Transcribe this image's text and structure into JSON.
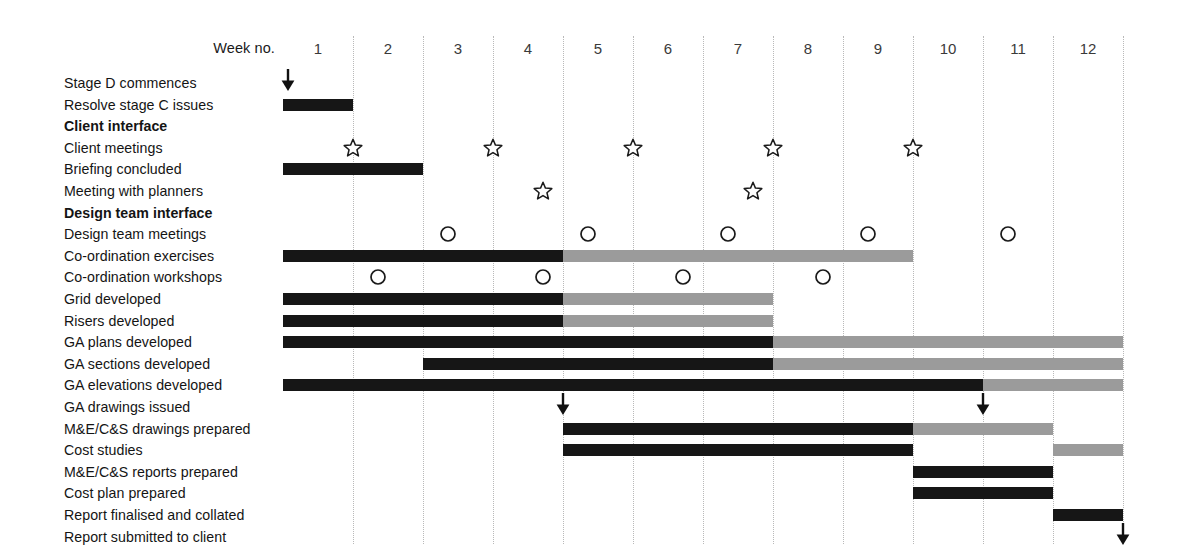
{
  "chart_data": {
    "type": "gantt",
    "title": "",
    "xlabel": "Week no.",
    "week_header_label": "Week no.",
    "weeks": [
      "1",
      "2",
      "3",
      "4",
      "5",
      "6",
      "7",
      "8",
      "9",
      "10",
      "11",
      "12"
    ],
    "week_count": 12,
    "colors": {
      "bar_primary": "#161616",
      "bar_secondary": "#9b9b9b",
      "gridline": "#b9b9b9",
      "text": "#141414",
      "background": "#ffffff"
    },
    "legend": [],
    "rows": [
      {
        "label": "Stage D commences",
        "bold": false,
        "bars": [],
        "markers": [],
        "arrows": [
          {
            "week": 1.07
          }
        ]
      },
      {
        "label": "Resolve stage C issues",
        "bold": false,
        "bars": [
          {
            "start": 1.0,
            "end": 2.0,
            "color": "black"
          }
        ],
        "markers": [],
        "arrows": []
      },
      {
        "label": "Client interface",
        "bold": true,
        "bars": [],
        "markers": [],
        "arrows": []
      },
      {
        "label": "Client meetings",
        "bold": false,
        "bars": [],
        "markers": [
          {
            "shape": "star",
            "week": 2.0
          },
          {
            "shape": "star",
            "week": 4.0
          },
          {
            "shape": "star",
            "week": 6.0
          },
          {
            "shape": "star",
            "week": 8.0
          },
          {
            "shape": "star",
            "week": 10.0
          }
        ],
        "arrows": []
      },
      {
        "label": "Briefing concluded",
        "bold": false,
        "bars": [
          {
            "start": 1.0,
            "end": 3.0,
            "color": "black"
          }
        ],
        "markers": [],
        "arrows": []
      },
      {
        "label": "Meeting with planners",
        "bold": false,
        "bars": [],
        "markers": [
          {
            "shape": "star",
            "week": 4.72
          },
          {
            "shape": "star",
            "week": 7.72
          }
        ],
        "arrows": []
      },
      {
        "label": "Design team interface",
        "bold": true,
        "bars": [],
        "markers": [],
        "arrows": []
      },
      {
        "label": "Design team meetings",
        "bold": false,
        "bars": [],
        "markers": [
          {
            "shape": "circle",
            "week": 3.36
          },
          {
            "shape": "circle",
            "week": 5.36
          },
          {
            "shape": "circle",
            "week": 7.36
          },
          {
            "shape": "circle",
            "week": 9.36
          },
          {
            "shape": "circle",
            "week": 11.36
          }
        ],
        "arrows": []
      },
      {
        "label": "Co-ordination exercises",
        "bold": false,
        "bars": [
          {
            "start": 1.0,
            "end": 5.0,
            "color": "black"
          },
          {
            "start": 5.0,
            "end": 10.0,
            "color": "grey"
          }
        ],
        "markers": [],
        "arrows": []
      },
      {
        "label": "Co-ordination workshops",
        "bold": false,
        "bars": [],
        "markers": [
          {
            "shape": "circle",
            "week": 2.36
          },
          {
            "shape": "circle",
            "week": 4.72
          },
          {
            "shape": "circle",
            "week": 6.72
          },
          {
            "shape": "circle",
            "week": 8.72
          }
        ],
        "arrows": []
      },
      {
        "label": "Grid developed",
        "bold": false,
        "bars": [
          {
            "start": 1.0,
            "end": 5.0,
            "color": "black"
          },
          {
            "start": 5.0,
            "end": 8.0,
            "color": "grey"
          }
        ],
        "markers": [],
        "arrows": []
      },
      {
        "label": "Risers developed",
        "bold": false,
        "bars": [
          {
            "start": 1.0,
            "end": 5.0,
            "color": "black"
          },
          {
            "start": 5.0,
            "end": 8.0,
            "color": "grey"
          }
        ],
        "markers": [],
        "arrows": []
      },
      {
        "label": "GA plans developed",
        "bold": false,
        "bars": [
          {
            "start": 1.0,
            "end": 8.0,
            "color": "black"
          },
          {
            "start": 8.0,
            "end": 13.0,
            "color": "grey"
          }
        ],
        "markers": [],
        "arrows": []
      },
      {
        "label": "GA sections developed",
        "bold": false,
        "bars": [
          {
            "start": 3.0,
            "end": 8.0,
            "color": "black"
          },
          {
            "start": 8.0,
            "end": 13.0,
            "color": "grey"
          }
        ],
        "markers": [],
        "arrows": []
      },
      {
        "label": "GA elevations developed",
        "bold": false,
        "bars": [
          {
            "start": 1.0,
            "end": 11.0,
            "color": "black"
          },
          {
            "start": 11.0,
            "end": 13.0,
            "color": "grey"
          }
        ],
        "markers": [],
        "arrows": []
      },
      {
        "label": "GA drawings issued",
        "bold": false,
        "bars": [],
        "markers": [],
        "arrows": [
          {
            "week": 5.0
          },
          {
            "week": 11.0
          }
        ]
      },
      {
        "label": "M&E/C&S drawings prepared",
        "bold": false,
        "bars": [
          {
            "start": 5.0,
            "end": 10.0,
            "color": "black"
          },
          {
            "start": 10.0,
            "end": 12.0,
            "color": "grey"
          }
        ],
        "markers": [],
        "arrows": []
      },
      {
        "label": "Cost studies",
        "bold": false,
        "bars": [
          {
            "start": 5.0,
            "end": 10.0,
            "color": "black"
          },
          {
            "start": 12.0,
            "end": 13.0,
            "color": "grey"
          }
        ],
        "markers": [],
        "arrows": []
      },
      {
        "label": "M&E/C&S reports prepared",
        "bold": false,
        "bars": [
          {
            "start": 10.0,
            "end": 12.0,
            "color": "black"
          }
        ],
        "markers": [],
        "arrows": []
      },
      {
        "label": "Cost plan prepared",
        "bold": false,
        "bars": [
          {
            "start": 10.0,
            "end": 12.0,
            "color": "black"
          }
        ],
        "markers": [],
        "arrows": []
      },
      {
        "label": "Report finalised and collated",
        "bold": false,
        "bars": [
          {
            "start": 12.0,
            "end": 13.0,
            "color": "black"
          }
        ],
        "markers": [],
        "arrows": []
      },
      {
        "label": "Report submitted to client",
        "bold": false,
        "bars": [],
        "markers": [],
        "arrows": [
          {
            "week": 13.0
          }
        ]
      }
    ]
  }
}
